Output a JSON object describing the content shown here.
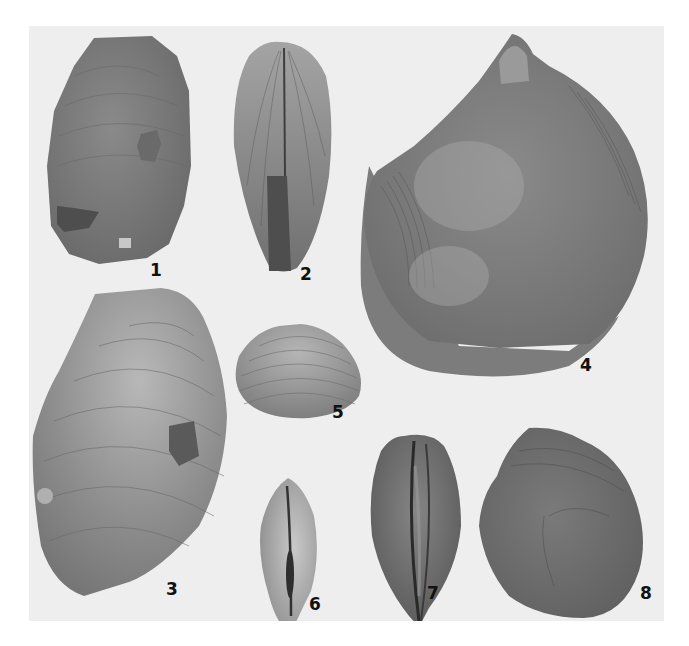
{
  "plate": {
    "background": "#eeeeee",
    "page_background": "#ffffff",
    "figures": [
      {
        "label": "1",
        "shell_color": "#7d7d7d"
      },
      {
        "label": "2",
        "shell_color": "#8a8a8a"
      },
      {
        "label": "3",
        "shell_color": "#8c8c8c"
      },
      {
        "label": "4",
        "shell_color": "#7a7a7a"
      },
      {
        "label": "5",
        "shell_color": "#9a9a9a"
      },
      {
        "label": "6",
        "shell_color": "#9c9c9c"
      },
      {
        "label": "7",
        "shell_color": "#6e6e6e"
      },
      {
        "label": "8",
        "shell_color": "#707070"
      }
    ]
  }
}
